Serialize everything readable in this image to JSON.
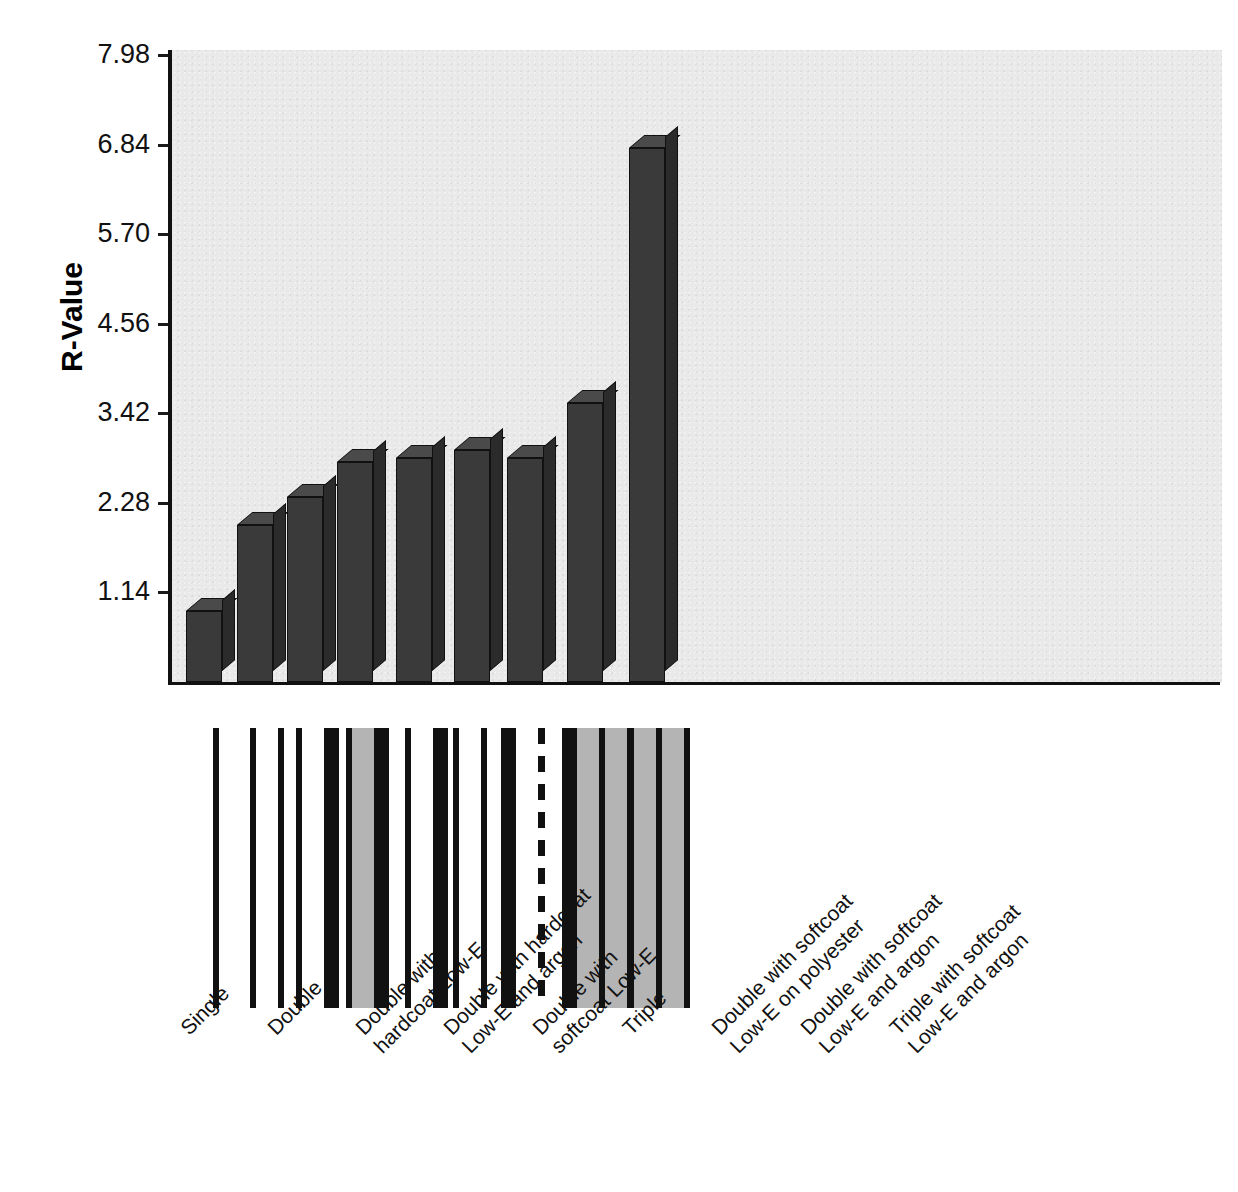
{
  "chart_data": {
    "type": "bar",
    "title": "",
    "xlabel": "",
    "ylabel": "R-Value",
    "ylim": [
      0,
      7.98
    ],
    "grid": false,
    "legend": "none",
    "ytick_labels": [
      "7.98",
      "6.84",
      "5.70",
      "4.56",
      "3.42",
      "2.28",
      "1.14"
    ],
    "ytick_values": [
      7.98,
      6.84,
      5.7,
      4.56,
      3.42,
      2.28,
      1.14
    ],
    "categories": [
      "Single",
      "Double",
      "Double with\nhardcoat Low-E",
      "Double with hardcoat\nLow-E and argon",
      "Double with\nsoftcoat Low-E",
      "Triple",
      "Double with softcoat\nLow-E on polyester",
      "Double with softcoat\nLow-E and argon",
      "Triple with softcoat\nLow-E and argon"
    ],
    "values": [
      0.9,
      2.0,
      2.35,
      2.8,
      2.85,
      2.95,
      2.85,
      3.55,
      6.8
    ],
    "series": [
      {
        "name": "R-Value",
        "values": [
          0.9,
          2.0,
          2.35,
          2.8,
          2.85,
          2.95,
          2.85,
          3.55,
          6.8
        ]
      }
    ]
  },
  "glazing_diagrams": [
    {
      "name": "single",
      "layers": [
        "pane-thin"
      ]
    },
    {
      "name": "double",
      "layers": [
        "pane-thin",
        "air-gap",
        "pane-thin"
      ]
    },
    {
      "name": "double-hardcoat-lowe",
      "layers": [
        "pane-thin",
        "air-gap",
        "pane-thick"
      ]
    },
    {
      "name": "double-hardcoat-lowe-argon",
      "layers": [
        "pane-thin",
        "argon-gap",
        "pane-thick"
      ]
    },
    {
      "name": "double-softcoat-lowe",
      "layers": [
        "pane-thin",
        "air-gap",
        "pane-thick"
      ]
    },
    {
      "name": "triple",
      "layers": [
        "pane-thin",
        "air-gap",
        "pane-thin",
        "air-gap",
        "pane-thin"
      ]
    },
    {
      "name": "double-softcoat-lowe-polyester",
      "layers": [
        "pane-thick",
        "air-gap",
        "polyester-film",
        "air-gap",
        "pane-thin"
      ]
    },
    {
      "name": "double-softcoat-lowe-argon",
      "layers": [
        "pane-thick",
        "argon-gap",
        "pane-thin",
        "argon-gap",
        "pane-thin"
      ]
    },
    {
      "name": "triple-softcoat-lowe-argon",
      "layers": [
        "pane-thin",
        "argon-gap",
        "pane-thin",
        "argon-gap",
        "pane-thin"
      ]
    }
  ],
  "colors": {
    "plot_background": "#e9e9e9",
    "bar_face": "#3a3a3a",
    "bar_top": "#4a4a4a",
    "bar_side": "#2b2b2b",
    "axis": "#111111",
    "argon_fill": "#b4b4b4",
    "pane": "#111111"
  }
}
